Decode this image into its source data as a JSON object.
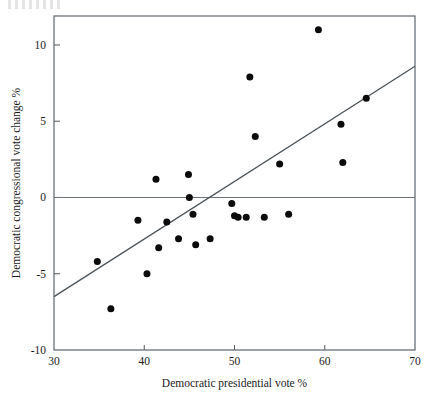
{
  "chart_data": {
    "type": "scatter",
    "title": "",
    "xlabel": "Democratic presidential vote %",
    "ylabel": "Democratic congressional vote change %",
    "xlim": [
      30,
      70
    ],
    "ylim": [
      -10,
      11.9
    ],
    "xticks": [
      30,
      40,
      50,
      60,
      70
    ],
    "yticks": [
      10,
      5,
      0,
      -5,
      -10
    ],
    "xtick_labels": [
      "30",
      "40",
      "50",
      "60",
      "70"
    ],
    "ytick_labels": [
      "10",
      "5",
      "0",
      "-5",
      "-10"
    ],
    "grid": false,
    "legend": null,
    "zero_reference_line": {
      "y": 0,
      "label": "0"
    },
    "fit_line": {
      "type": "linear-regression",
      "x_start": 30.0,
      "y_start": -6.5,
      "x_end": 70.0,
      "y_end": 8.6
    },
    "points": [
      {
        "x": 34.8,
        "y": -4.2
      },
      {
        "x": 36.3,
        "y": -7.3
      },
      {
        "x": 39.3,
        "y": -1.5
      },
      {
        "x": 40.3,
        "y": -5.0
      },
      {
        "x": 41.3,
        "y": 1.2
      },
      {
        "x": 41.6,
        "y": -3.3
      },
      {
        "x": 42.5,
        "y": -1.6
      },
      {
        "x": 43.8,
        "y": -2.7
      },
      {
        "x": 44.9,
        "y": 1.5
      },
      {
        "x": 45.0,
        "y": 0.0
      },
      {
        "x": 45.4,
        "y": -1.1
      },
      {
        "x": 45.7,
        "y": -3.1
      },
      {
        "x": 47.3,
        "y": -2.7
      },
      {
        "x": 49.7,
        "y": -0.4
      },
      {
        "x": 50.0,
        "y": -1.2
      },
      {
        "x": 50.4,
        "y": -1.3
      },
      {
        "x": 51.3,
        "y": -1.3
      },
      {
        "x": 51.7,
        "y": 7.9
      },
      {
        "x": 52.3,
        "y": 4.0
      },
      {
        "x": 53.3,
        "y": -1.3
      },
      {
        "x": 55.0,
        "y": 2.2
      },
      {
        "x": 56.0,
        "y": -1.1
      },
      {
        "x": 59.3,
        "y": 11.0
      },
      {
        "x": 61.8,
        "y": 4.8
      },
      {
        "x": 62.0,
        "y": 2.3
      },
      {
        "x": 64.6,
        "y": 6.5
      }
    ]
  },
  "figure": {
    "axis": {
      "x_title": "Democratic presidential vote %",
      "y_title": "Democratic congressional vote change %"
    }
  }
}
